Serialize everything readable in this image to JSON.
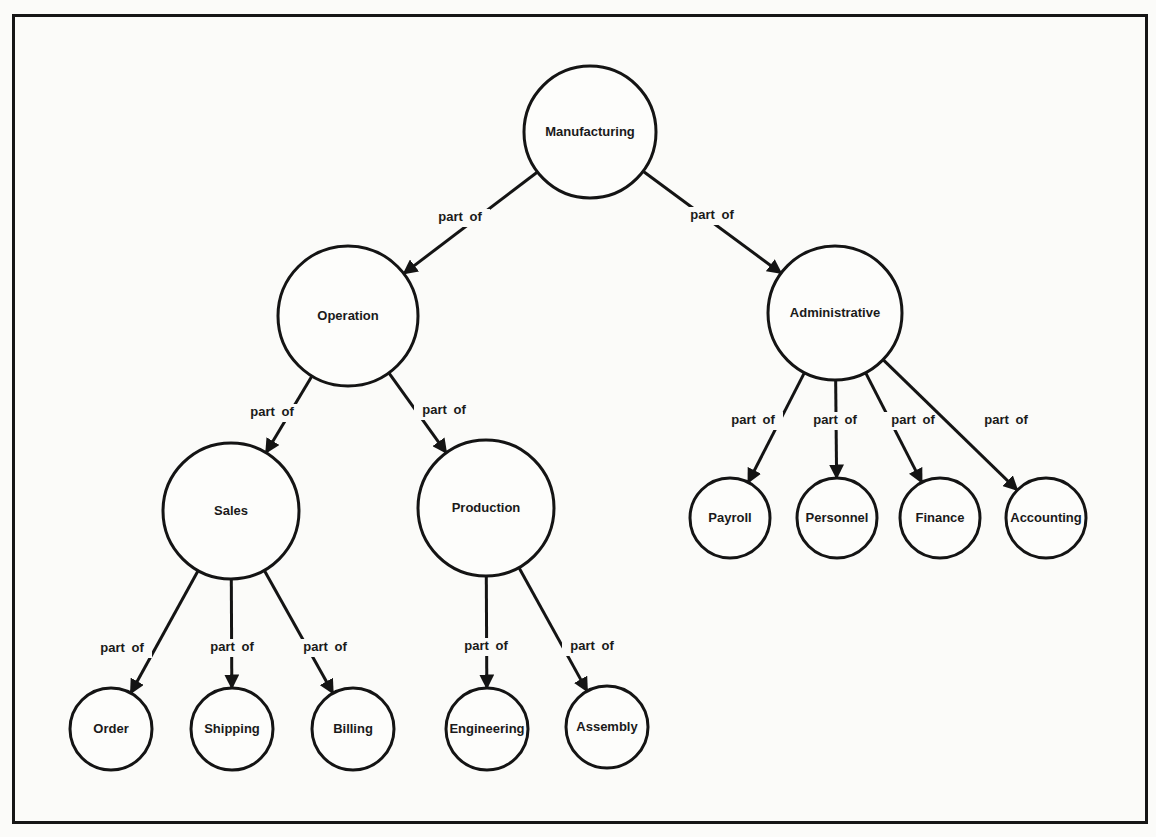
{
  "diagram": {
    "type": "hierarchy",
    "relation_label": "part of",
    "nodes": [
      {
        "id": "manufacturing",
        "label": "Manufacturing",
        "cx": 590,
        "cy": 132,
        "r": 66
      },
      {
        "id": "operation",
        "label": "Operation",
        "cx": 348,
        "cy": 316,
        "r": 70
      },
      {
        "id": "administrative",
        "label": "Administrative",
        "cx": 835,
        "cy": 313,
        "r": 67
      },
      {
        "id": "sales",
        "label": "Sales",
        "cx": 231,
        "cy": 511,
        "r": 68
      },
      {
        "id": "production",
        "label": "Production",
        "cx": 486,
        "cy": 508,
        "r": 68
      },
      {
        "id": "order",
        "label": "Order",
        "cx": 111,
        "cy": 729,
        "r": 41
      },
      {
        "id": "shipping",
        "label": "Shipping",
        "cx": 232,
        "cy": 729,
        "r": 41
      },
      {
        "id": "billing",
        "label": "Billing",
        "cx": 353,
        "cy": 729,
        "r": 41
      },
      {
        "id": "engineering",
        "label": "Engineering",
        "cx": 487,
        "cy": 729,
        "r": 41
      },
      {
        "id": "assembly",
        "label": "Assembly",
        "cx": 607,
        "cy": 727,
        "r": 41
      },
      {
        "id": "payroll",
        "label": "Payroll",
        "cx": 730,
        "cy": 518,
        "r": 40
      },
      {
        "id": "personnel",
        "label": "Personnel",
        "cx": 837,
        "cy": 518,
        "r": 40
      },
      {
        "id": "finance",
        "label": "Finance",
        "cx": 940,
        "cy": 518,
        "r": 40
      },
      {
        "id": "accounting",
        "label": "Accounting",
        "cx": 1046,
        "cy": 518,
        "r": 40
      }
    ],
    "edges": [
      {
        "from": "manufacturing",
        "to": "operation",
        "label": "part of",
        "lx": 460,
        "ly": 218
      },
      {
        "from": "manufacturing",
        "to": "administrative",
        "label": "part of",
        "lx": 712,
        "ly": 216
      },
      {
        "from": "operation",
        "to": "sales",
        "label": "part of",
        "lx": 272,
        "ly": 413
      },
      {
        "from": "operation",
        "to": "production",
        "label": "part of",
        "lx": 444,
        "ly": 411
      },
      {
        "from": "sales",
        "to": "order",
        "label": "part of",
        "lx": 122,
        "ly": 649
      },
      {
        "from": "sales",
        "to": "shipping",
        "label": "part of",
        "lx": 232,
        "ly": 648
      },
      {
        "from": "sales",
        "to": "billing",
        "label": "part of",
        "lx": 325,
        "ly": 648
      },
      {
        "from": "production",
        "to": "engineering",
        "label": "part of",
        "lx": 486,
        "ly": 647
      },
      {
        "from": "production",
        "to": "assembly",
        "label": "part of",
        "lx": 592,
        "ly": 647
      },
      {
        "from": "administrative",
        "to": "payroll",
        "label": "part of",
        "lx": 753,
        "ly": 421
      },
      {
        "from": "administrative",
        "to": "personnel",
        "label": "part of",
        "lx": 835,
        "ly": 421
      },
      {
        "from": "administrative",
        "to": "finance",
        "label": "part of",
        "lx": 913,
        "ly": 421
      },
      {
        "from": "administrative",
        "to": "accounting",
        "label": "part of",
        "lx": 1006,
        "ly": 421
      }
    ]
  },
  "colors": {
    "stroke": "#141414",
    "background": "#fbfbf9",
    "text": "#1a1a1a"
  }
}
